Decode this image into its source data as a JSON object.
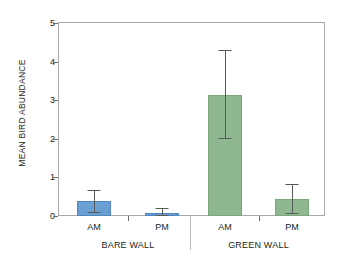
{
  "chart_data": {
    "type": "bar",
    "title": "",
    "xlabel": "",
    "ylabel": "MEAN BIRD ABUNDANCE",
    "ylim": [
      0,
      5
    ],
    "ytick_labels": [
      "0",
      "1",
      "2",
      "3",
      "4",
      "5"
    ],
    "ytick_values": [
      0,
      1,
      2,
      3,
      4,
      5
    ],
    "grid": false,
    "legend": "none",
    "groups": [
      {
        "label": "BARE WALL",
        "color": "#6a9fd4",
        "categories": [
          "AM",
          "PM"
        ],
        "values": [
          0.4,
          0.09
        ],
        "error_low": [
          0.1,
          0.02
        ],
        "error_high": [
          0.67,
          0.22
        ]
      },
      {
        "label": "GREEN WALL",
        "color": "#8fb890",
        "categories": [
          "AM",
          "PM"
        ],
        "values": [
          3.13,
          0.45
        ],
        "error_low": [
          2.01,
          0.08
        ],
        "error_high": [
          4.3,
          0.84
        ]
      }
    ],
    "categories": [
      "AM",
      "PM",
      "AM",
      "PM"
    ],
    "values": [
      0.4,
      0.09,
      3.13,
      0.45
    ],
    "error_low": [
      0.1,
      0.02,
      2.01,
      0.08
    ],
    "error_high": [
      0.67,
      0.22,
      4.3,
      0.84
    ],
    "colors": {
      "bare_wall_bar": "#6a9fd4",
      "green_wall_bar": "#8fb890",
      "axis": "#a7a9ac",
      "error_bar": "#58595b",
      "text": "#231f20",
      "background": "#ffffff"
    }
  }
}
